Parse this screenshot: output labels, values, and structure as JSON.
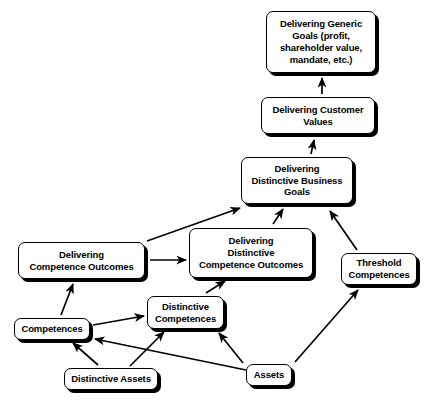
{
  "diagram": {
    "background_color": "#ffffff",
    "line_color": "#000000",
    "box_fill": "#ffffff",
    "nodes": [
      {
        "id": "generic-goals",
        "label": "Delivering Generic\nGoals (profit,\nshareholder value,\nmandate, etc.)",
        "x": 266,
        "y": 11,
        "width": 110,
        "height": 62
      },
      {
        "id": "customer-values",
        "label": "Delivering Customer\nValues",
        "x": 261,
        "y": 97,
        "width": 114,
        "height": 37
      },
      {
        "id": "business-goals",
        "label": "Delivering\nDistinctive Business\nGoals",
        "x": 241,
        "y": 157,
        "width": 112,
        "height": 47
      },
      {
        "id": "competence-outcomes",
        "label": "Delivering\nCompetence Outcomes",
        "x": 18,
        "y": 242,
        "width": 127,
        "height": 37
      },
      {
        "id": "distinctive-competence-outcomes",
        "label": "Delivering\nDistinctive\nCompetence Outcomes",
        "x": 189,
        "y": 228,
        "width": 124,
        "height": 50
      },
      {
        "id": "threshold-competences",
        "label": "Threshold\nCompetences",
        "x": 341,
        "y": 253,
        "width": 76,
        "height": 32
      },
      {
        "id": "competences",
        "label": "Competences",
        "x": 14,
        "y": 318,
        "width": 76,
        "height": 22
      },
      {
        "id": "distinctive-competences",
        "label": "Distinctive\nCompetences",
        "x": 147,
        "y": 296,
        "width": 77,
        "height": 33
      },
      {
        "id": "distinctive-assets",
        "label": "Distinctive Assets",
        "x": 64,
        "y": 368,
        "width": 94,
        "height": 22
      },
      {
        "id": "assets",
        "label": "Assets",
        "x": 246,
        "y": 364,
        "width": 46,
        "height": 22
      }
    ],
    "arrows": [
      {
        "id": "customer-values-to-generic-goals",
        "from": "customer-values",
        "to": "generic-goals",
        "x1": 322,
        "y1": 94,
        "x2": 322,
        "y2": 78
      },
      {
        "id": "business-goals-to-customer-values",
        "from": "business-goals",
        "to": "customer-values",
        "x1": 311,
        "y1": 154,
        "x2": 314,
        "y2": 140
      },
      {
        "id": "competence-outcomes-to-business-goals",
        "from": "competence-outcomes",
        "to": "business-goals",
        "x1": 147,
        "y1": 241,
        "x2": 240,
        "y2": 208
      },
      {
        "id": "distinctive-competence-outcomes-to-business-goals",
        "from": "distinctive-competence-outcomes",
        "to": "business-goals",
        "x1": 273,
        "y1": 224,
        "x2": 283,
        "y2": 209
      },
      {
        "id": "threshold-competences-to-business-goals",
        "from": "threshold-competences",
        "to": "business-goals",
        "x1": 357,
        "y1": 250,
        "x2": 330,
        "y2": 211
      },
      {
        "id": "competence-outcomes-to-distinctive-competence-outcomes",
        "from": "competence-outcomes",
        "to": "distinctive-competence-outcomes",
        "x1": 150,
        "y1": 260,
        "x2": 186,
        "y2": 260
      },
      {
        "id": "competences-to-competence-outcomes",
        "from": "competences",
        "to": "competence-outcomes",
        "x1": 61,
        "y1": 315,
        "x2": 73,
        "y2": 284
      },
      {
        "id": "distinctive-competences-to-distinctive-competence-outcomes",
        "from": "distinctive-competences",
        "to": "distinctive-competence-outcomes",
        "x1": 206,
        "y1": 293,
        "x2": 225,
        "y2": 281
      },
      {
        "id": "competences-to-distinctive-competences",
        "from": "competences",
        "to": "distinctive-competences",
        "x1": 93,
        "y1": 325,
        "x2": 144,
        "y2": 316
      },
      {
        "id": "distinctive-assets-to-competences",
        "from": "distinctive-assets",
        "to": "competences",
        "x1": 98,
        "y1": 365,
        "x2": 73,
        "y2": 343
      },
      {
        "id": "distinctive-assets-to-distinctive-competences",
        "from": "distinctive-assets",
        "to": "distinctive-competences",
        "x1": 130,
        "y1": 366,
        "x2": 164,
        "y2": 332
      },
      {
        "id": "assets-to-distinctive-competences",
        "from": "assets",
        "to": "distinctive-competences",
        "x1": 243,
        "y1": 363,
        "x2": 219,
        "y2": 333
      },
      {
        "id": "assets-to-competences",
        "from": "assets",
        "to": "competences",
        "x1": 246,
        "y1": 370,
        "x2": 95,
        "y2": 339
      },
      {
        "id": "assets-to-threshold-competences",
        "from": "assets",
        "to": "threshold-competences",
        "x1": 295,
        "y1": 362,
        "x2": 358,
        "y2": 290
      }
    ]
  }
}
